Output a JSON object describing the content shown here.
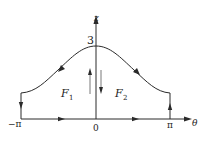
{
  "diagram": {
    "axes": {
      "vertical_label": "z",
      "horizontal_label": "θ",
      "peak_value_label": "3",
      "x_tick_labels": {
        "left": "−π",
        "center": "0",
        "right": "π"
      }
    },
    "regions": [
      {
        "name": "F",
        "subscript": "1"
      },
      {
        "name": "F",
        "subscript": "2"
      }
    ],
    "colors": {
      "stroke": "#2a2a2a",
      "background": "#ffffff"
    }
  }
}
